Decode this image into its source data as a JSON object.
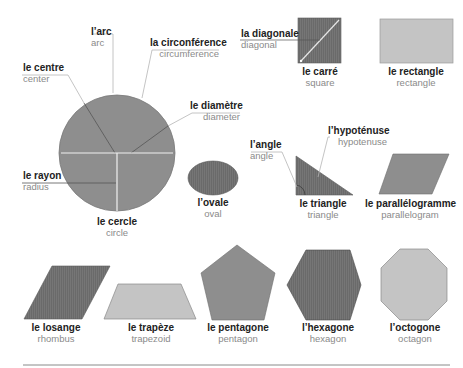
{
  "colors": {
    "dark_fill": "#6e6e6e",
    "mid_fill": "#8e8e8e",
    "light_fill": "#c4c4c4",
    "leader_line": "#b5b5b5",
    "white_line": "#f0f0f0",
    "rule": "#8a8a8a",
    "fr_text": "#222222",
    "en_text": "#8a8a8a"
  },
  "circle_parts": {
    "arc": {
      "fr": "l’arc",
      "en": "arc"
    },
    "circumference": {
      "fr": "la circonférence",
      "en": "circumference"
    },
    "center": {
      "fr": "le centre",
      "en": "center"
    },
    "diameter": {
      "fr": "le diamètre",
      "en": "diameter"
    },
    "radius": {
      "fr": "le rayon",
      "en": "radius"
    }
  },
  "square_parts": {
    "diagonal": {
      "fr": "la diagonale",
      "en": "diagonal"
    }
  },
  "triangle_parts": {
    "angle": {
      "fr": "l’angle",
      "en": "angle"
    },
    "hypotenuse": {
      "fr": "l’hypoténuse",
      "en": "hypotenuse"
    }
  },
  "shapes": [
    {
      "id": "circle",
      "fr": "le cercle",
      "en": "circle"
    },
    {
      "id": "oval",
      "fr": "l’ovale",
      "en": "oval"
    },
    {
      "id": "square",
      "fr": "le carré",
      "en": "square"
    },
    {
      "id": "rectangle",
      "fr": "le rectangle",
      "en": "rectangle"
    },
    {
      "id": "triangle",
      "fr": "le triangle",
      "en": "triangle"
    },
    {
      "id": "parallelogram",
      "fr": "le parallélogramme",
      "en": "parallelogram"
    },
    {
      "id": "rhombus",
      "fr": "le losange",
      "en": "rhombus"
    },
    {
      "id": "trapezoid",
      "fr": "le trapèze",
      "en": "trapezoid"
    },
    {
      "id": "pentagon",
      "fr": "le pentagone",
      "en": "pentagon"
    },
    {
      "id": "hexagon",
      "fr": "l’hexagone",
      "en": "hexagon"
    },
    {
      "id": "octagon",
      "fr": "l’octogone",
      "en": "octagon"
    }
  ]
}
